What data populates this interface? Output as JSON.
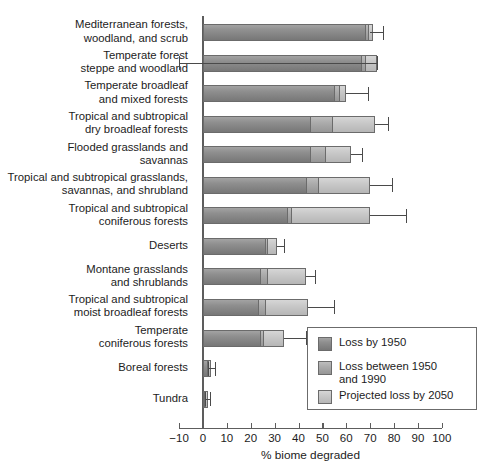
{
  "chart_data": {
    "type": "bar",
    "orientation": "horizontal",
    "stacked": true,
    "title": "",
    "xlabel": "% biome degraded",
    "ylabel": "",
    "xlim": [
      -10,
      100
    ],
    "xticks": [
      -10,
      0,
      10,
      20,
      30,
      40,
      50,
      60,
      70,
      80,
      90,
      100
    ],
    "xticklabels": [
      "−10",
      "0",
      "10",
      "20",
      "30",
      "40",
      "50",
      "60",
      "70",
      "80",
      "90",
      "100"
    ],
    "grid": false,
    "legend_position": "lower-right-inside",
    "series": [
      {
        "name": "Loss by 1950",
        "color": "#8f8f8f"
      },
      {
        "name": "Loss between 1950\nand 1990",
        "color": "#ababab"
      },
      {
        "name": "Projected loss by 2050",
        "color": "#c8c8c8"
      }
    ],
    "categories": [
      "Mediterranean forests,\nwoodland, and scrub",
      "Temperate forest\nsteppe and woodland",
      "Temperate broadleaf\nand mixed forests",
      "Tropical and subtropical\ndry broadleaf forests",
      "Flooded grasslands and\nsavannas",
      "Tropical and subtropical grasslands,\nsavannas, and shrubland",
      "Tropical and subtropical\nconiferous forests",
      "Deserts",
      "Montane grasslands\nand shrublands",
      "Tropical and subtropical\nmoist broadleaf forests",
      "Temperate\nconiferous forests",
      "Boreal forests",
      "Tundra"
    ],
    "values": [
      {
        "category": "Mediterranean forests, woodland, and scrub",
        "loss_1950": 68.0,
        "loss_1950_1990": 1.0,
        "projected_2050": 2.0,
        "total": 71.0,
        "error_high": 75.5,
        "error_low": 70.0
      },
      {
        "category": "Temperate forest steppe and woodland",
        "loss_1950": 66.0,
        "loss_1950_1990": 2.0,
        "projected_2050": 5.0,
        "total": 73.0,
        "error_high": 73.0,
        "error_low": -10.0
      },
      {
        "category": "Temperate broadleaf and mixed forests",
        "loss_1950": 55.0,
        "loss_1950_1990": 2.0,
        "projected_2050": 3.0,
        "total": 60.0,
        "error_high": 69.0,
        "error_low": 60.0
      },
      {
        "category": "Tropical and subtropical dry broadleaf forests",
        "loss_1950": 45.0,
        "loss_1950_1990": 9.0,
        "projected_2050": 18.0,
        "total": 72.0,
        "error_high": 77.5,
        "error_low": 72.0
      },
      {
        "category": "Flooded grasslands and savannas",
        "loss_1950": 45.0,
        "loss_1950_1990": 6.0,
        "projected_2050": 11.0,
        "total": 62.0,
        "error_high": 66.5,
        "error_low": 62.0
      },
      {
        "category": "Tropical and subtropical grasslands, savannas, and shrubland",
        "loss_1950": 43.0,
        "loss_1950_1990": 5.0,
        "projected_2050": 22.0,
        "total": 70.0,
        "error_high": 79.0,
        "error_low": 70.0
      },
      {
        "category": "Tropical and subtropical coniferous forests",
        "loss_1950": 35.0,
        "loss_1950_1990": 2.0,
        "projected_2050": 33.0,
        "total": 70.0,
        "error_high": 85.0,
        "error_low": 70.0
      },
      {
        "category": "Deserts",
        "loss_1950": 26.0,
        "loss_1950_1990": 1.0,
        "projected_2050": 4.0,
        "total": 31.0,
        "error_high": 34.0,
        "error_low": 31.0
      },
      {
        "category": "Montane grasslands and shrublands",
        "loss_1950": 24.0,
        "loss_1950_1990": 3.0,
        "projected_2050": 16.0,
        "total": 43.0,
        "error_high": 47.0,
        "error_low": 43.0
      },
      {
        "category": "Tropical and subtropical moist broadleaf forests",
        "loss_1950": 23.0,
        "loss_1950_1990": 3.0,
        "projected_2050": 18.0,
        "total": 44.0,
        "error_high": 55.0,
        "error_low": 44.0
      },
      {
        "category": "Temperate coniferous forests",
        "loss_1950": 24.0,
        "loss_1950_1990": 1.0,
        "projected_2050": 9.0,
        "total": 34.0,
        "error_high": 43.0,
        "error_low": 34.0
      },
      {
        "category": "Boreal forests",
        "loss_1950": 1.5,
        "loss_1950_1990": 0.6,
        "projected_2050": 1.4,
        "total": 3.5,
        "error_high": 5.0,
        "error_low": 2.0
      },
      {
        "category": "Tundra",
        "loss_1950": 0.6,
        "loss_1950_1990": 0.4,
        "projected_2050": 1.0,
        "total": 2.0,
        "error_high": 3.0,
        "error_low": 1.0
      }
    ]
  },
  "legend": {
    "items": [
      {
        "label": "Loss by 1950"
      },
      {
        "label": "Loss between 1950\nand 1990"
      },
      {
        "label": "Projected loss by 2050"
      }
    ]
  },
  "axis": {
    "x_title": "% biome degraded"
  }
}
